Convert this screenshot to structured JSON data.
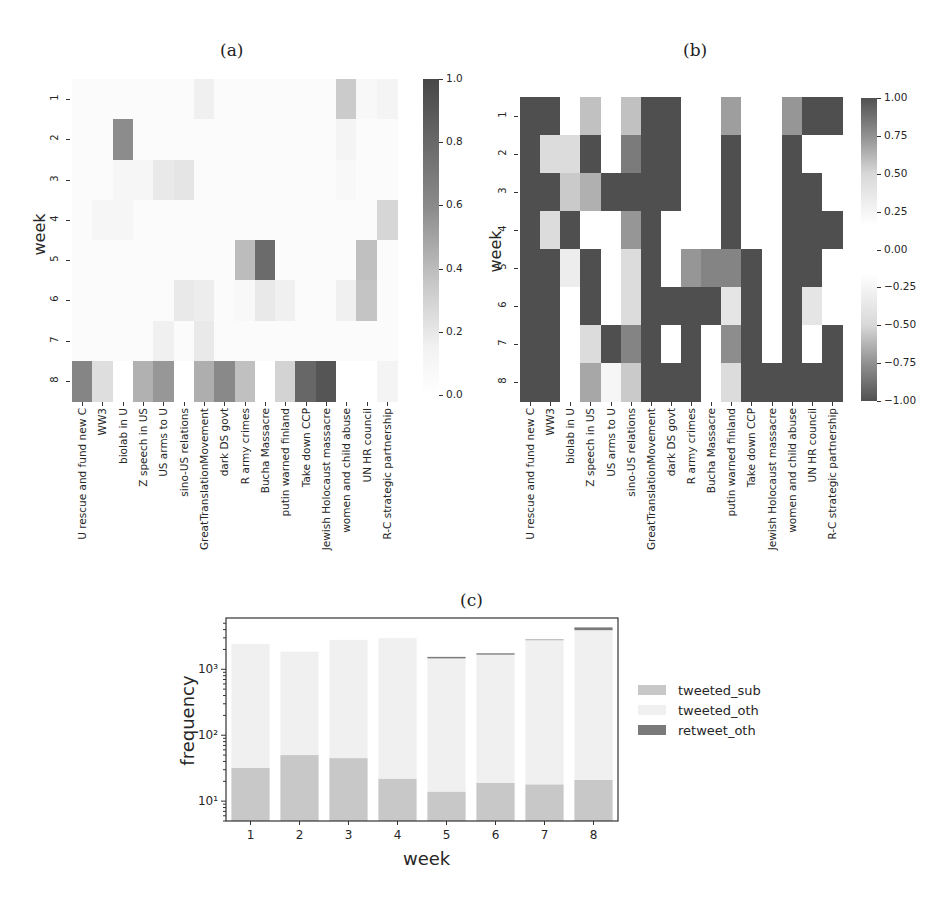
{
  "panels": {
    "a": {
      "label": "(a)"
    },
    "b": {
      "label": "(b)"
    },
    "c": {
      "label": "(c)"
    }
  },
  "chart_data": [
    {
      "id": "a",
      "type": "heatmap",
      "title": "(a)",
      "xlabel": "",
      "ylabel": "week",
      "rows": [
        "1",
        "2",
        "3",
        "4",
        "5",
        "6",
        "7",
        "8"
      ],
      "columns": [
        "U rescue and fund new C",
        "WW3",
        "biolab in U",
        "Z speech in US",
        "US arms to U",
        "sino-US relations",
        "GreatTranslationMovement",
        "dark DS govt",
        "R army crimes",
        "Bucha Massacre",
        "putin warned finland",
        "Take down CCP",
        "Jewish Holocaust massacre",
        "women and child abuse",
        "UN HR council",
        "R-C strategic partnership"
      ],
      "values": [
        [
          0.02,
          0.02,
          0.02,
          0.02,
          0.02,
          0.02,
          0.08,
          0.02,
          0.02,
          0.02,
          0.02,
          0.02,
          0.02,
          0.28,
          0.04,
          0.06
        ],
        [
          0.02,
          0.02,
          0.62,
          0.02,
          0.02,
          0.02,
          0.02,
          0.02,
          0.02,
          0.02,
          0.02,
          0.02,
          0.02,
          0.06,
          0.02,
          0.02
        ],
        [
          0.02,
          0.02,
          0.05,
          0.05,
          0.12,
          0.14,
          0.02,
          0.02,
          0.02,
          0.02,
          0.02,
          0.02,
          0.02,
          0.04,
          0.02,
          0.02
        ],
        [
          0.02,
          0.05,
          0.05,
          0.02,
          0.02,
          0.02,
          0.02,
          0.02,
          0.02,
          0.02,
          0.02,
          0.02,
          0.02,
          0.02,
          0.02,
          0.22
        ],
        [
          0.02,
          0.02,
          0.02,
          0.02,
          0.02,
          0.02,
          0.02,
          0.02,
          0.36,
          0.8,
          0.02,
          0.02,
          0.02,
          0.02,
          0.34,
          0.02
        ],
        [
          0.02,
          0.02,
          0.02,
          0.02,
          0.02,
          0.12,
          0.1,
          0.02,
          0.04,
          0.12,
          0.08,
          0.02,
          0.02,
          0.08,
          0.32,
          0.02
        ],
        [
          0.02,
          0.02,
          0.02,
          0.02,
          0.08,
          0.02,
          0.12,
          0.02,
          0.02,
          0.02,
          0.02,
          0.02,
          0.02,
          0.02,
          0.02,
          0.02
        ],
        [
          0.66,
          0.18,
          0.0,
          0.42,
          0.56,
          0.0,
          0.44,
          0.64,
          0.34,
          0.0,
          0.24,
          0.82,
          0.92,
          0.0,
          0.0,
          0.06
        ]
      ],
      "colorbar": {
        "min": 0.0,
        "max": 1.0,
        "ticks": [
          "1.0",
          "0.8",
          "0.6",
          "0.4",
          "0.2",
          "0.0"
        ]
      }
    },
    {
      "id": "b",
      "type": "heatmap",
      "title": "(b)",
      "xlabel": "",
      "ylabel": "week",
      "rows": [
        "1",
        "2",
        "3",
        "4",
        "5",
        "6",
        "7",
        "8"
      ],
      "columns": [
        "U rescue and fund new C",
        "WW3",
        "biolab in U",
        "Z speech in US",
        "US arms to U",
        "sino-US relations",
        "GreatTranslationMovement",
        "dark DS govt",
        "R army crimes",
        "Bucha Massacre",
        "putin warned finland",
        "Take down CCP",
        "Jewish Holocaust massacre",
        "women and child abuse",
        "UN HR council",
        "R-C strategic partnership"
      ],
      "values": [
        [
          1,
          1,
          0,
          0.35,
          0,
          0.35,
          1,
          1,
          0,
          0,
          0.55,
          0,
          0,
          0.6,
          1,
          1
        ],
        [
          1,
          0.2,
          0.2,
          1,
          0,
          0.75,
          1,
          1,
          0,
          0,
          1,
          0,
          0,
          1,
          0,
          0
        ],
        [
          1,
          1,
          0.3,
          0.45,
          1,
          1,
          1,
          1,
          0,
          0,
          1,
          0,
          0,
          1,
          1,
          0
        ],
        [
          1,
          0.2,
          1,
          0,
          0,
          0.6,
          1,
          0,
          0,
          0,
          1,
          0,
          0,
          1,
          1,
          1
        ],
        [
          -1,
          -1,
          -0.1,
          -1,
          0,
          -0.2,
          -1,
          0,
          -0.6,
          -0.7,
          -0.7,
          -1,
          0,
          -1,
          -1,
          0
        ],
        [
          -1,
          -1,
          0,
          -1,
          0,
          -0.2,
          -1,
          -1,
          -1,
          -1,
          -0.15,
          -1,
          0,
          -1,
          -0.15,
          0
        ],
        [
          -1,
          -1,
          0,
          -0.2,
          -1,
          -0.7,
          -1,
          0,
          -1,
          0,
          -0.65,
          -1,
          0,
          -1,
          0,
          -1
        ],
        [
          -1,
          -1,
          0,
          -0.5,
          -0.05,
          -0.3,
          -1,
          -1,
          -1,
          0,
          -0.2,
          -1,
          -1,
          -1,
          -1,
          -1
        ]
      ],
      "colorbar": {
        "min": -1.0,
        "max": 1.0,
        "ticks": [
          "1.00",
          "0.75",
          "0.50",
          "0.25",
          "0.00",
          "−0.25",
          "−0.50",
          "−0.75",
          "−1.00"
        ]
      }
    },
    {
      "id": "c",
      "type": "bar",
      "stacked": true,
      "yscale": "log",
      "title": "(c)",
      "xlabel": "week",
      "ylabel": "frequency",
      "categories": [
        "1",
        "2",
        "3",
        "4",
        "5",
        "6",
        "7",
        "8"
      ],
      "ylim": [
        5,
        6000
      ],
      "yticks": [
        "10¹",
        "10²",
        "10³"
      ],
      "series": [
        {
          "name": "tweeted_sub",
          "color": "#c8c8c8",
          "values": [
            27,
            45,
            40,
            17,
            9,
            14,
            13,
            16
          ]
        },
        {
          "name": "tweeted_oth",
          "color": "#f0f0f0",
          "values": [
            2400,
            1800,
            2750,
            2950,
            1450,
            1650,
            2750,
            3900
          ]
        },
        {
          "name": "retweet_oth",
          "color": "#7a7a7a",
          "values": [
            0,
            0,
            0,
            0,
            80,
            80,
            60,
            400
          ]
        }
      ],
      "legend": {
        "position": "right",
        "entries": [
          "tweeted_sub",
          "tweeted_oth",
          "retweet_oth"
        ]
      }
    }
  ],
  "axis_labels": {
    "week": "week",
    "frequency": "frequency"
  },
  "legend": {
    "tweeted_sub": "tweeted_sub",
    "tweeted_oth": "tweeted_oth",
    "retweet_oth": "retweet_oth"
  }
}
